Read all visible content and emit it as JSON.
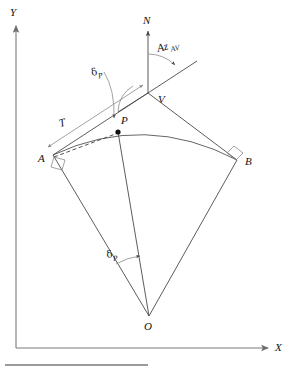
{
  "figure": {
    "type": "geometry-diagram",
    "axes": {
      "y_label": "Y",
      "x_label": "X"
    },
    "points": [
      {
        "id": "A",
        "label": "A",
        "x": 53,
        "y": 155,
        "marker": "right-angle"
      },
      {
        "id": "B",
        "label": "B",
        "x": 237,
        "y": 160,
        "marker": "right-angle"
      },
      {
        "id": "V",
        "label": "V",
        "x": 148,
        "y": 93,
        "marker": "vertex"
      },
      {
        "id": "P",
        "label": "P",
        "x": 118,
        "y": 132,
        "marker": "filled-dot"
      },
      {
        "id": "O",
        "label": "O",
        "x": 149,
        "y": 316,
        "marker": "center"
      },
      {
        "id": "N",
        "label": "N",
        "x": 148,
        "y": 32,
        "marker": "north-arrow"
      }
    ],
    "annotations": [
      {
        "id": "az",
        "label": "Az",
        "subscript": "AV",
        "x": 170,
        "y": 57
      },
      {
        "id": "delta-top",
        "label": "δ",
        "subscript": "P",
        "x": 98,
        "y": 80
      },
      {
        "id": "tangent",
        "label": "T",
        "subscript": "",
        "x": 63,
        "y": 124
      },
      {
        "id": "delta-bottom",
        "label": "δ",
        "subscript": "P",
        "x": 112,
        "y": 259
      }
    ],
    "colors": {
      "line": "#4a4a4a",
      "axis": "#7a7a7a",
      "dashed": "#3f3f3f",
      "text": "#111111",
      "background": "#ffffff",
      "rule": "#9a9a9a"
    }
  }
}
